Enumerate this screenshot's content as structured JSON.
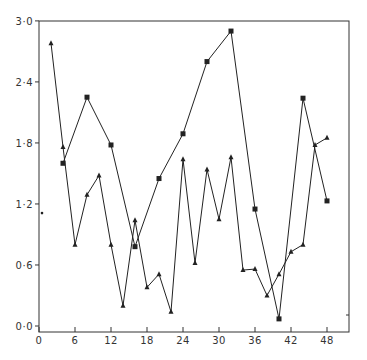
{
  "chart_data": {
    "type": "line",
    "title": "",
    "xlabel": "",
    "ylabel": "",
    "xlim": [
      0,
      51.7
    ],
    "ylim": [
      -0.06,
      3.0
    ],
    "grid": false,
    "legend": null,
    "x_ticks": [
      0,
      6,
      12,
      18,
      24,
      30,
      36,
      42,
      48
    ],
    "x_tick_labels": [
      "0",
      "6",
      "12",
      "18",
      "24",
      "30",
      "36",
      "42",
      "48"
    ],
    "y_ticks": [
      0.0,
      0.6,
      1.2,
      1.8,
      2.4,
      3.0
    ],
    "y_tick_labels": [
      "0·0",
      "0·6",
      "1·2",
      "1·8",
      "2·4",
      "3·0"
    ],
    "series": [
      {
        "name": "triangles",
        "marker": "triangle",
        "x": [
          2,
          4,
          6,
          8,
          10,
          12,
          14,
          16,
          18,
          20,
          22,
          24,
          26,
          28,
          30,
          32,
          34,
          36,
          38,
          40,
          42,
          44,
          46,
          48
        ],
        "values": [
          2.78,
          1.76,
          0.8,
          1.29,
          1.48,
          0.8,
          0.2,
          1.04,
          0.38,
          0.51,
          0.14,
          1.64,
          0.62,
          1.54,
          1.05,
          1.66,
          0.55,
          0.56,
          0.3,
          0.51,
          0.73,
          0.8,
          1.78,
          1.85
        ]
      },
      {
        "name": "squares",
        "marker": "square",
        "x": [
          4,
          8,
          12,
          16,
          20,
          24,
          28,
          32,
          36,
          40,
          44,
          48
        ],
        "values": [
          1.6,
          2.25,
          1.78,
          0.78,
          1.45,
          1.89,
          2.6,
          2.9,
          1.15,
          0.07,
          2.24,
          1.23
        ]
      },
      {
        "name": "isolated-point",
        "marker": "dot",
        "x": [
          0.5
        ],
        "values": [
          1.11
        ]
      }
    ]
  },
  "layout": {
    "plot_left": 39,
    "plot_right": 349,
    "plot_top": 21,
    "plot_bottom": 332,
    "x_px_per_unit": 6.0,
    "y_zero_px": 326,
    "y_px_per_unit": 101.7
  },
  "colors": {
    "line": "#222222",
    "axis": "#333333",
    "background": "#ffffff"
  }
}
